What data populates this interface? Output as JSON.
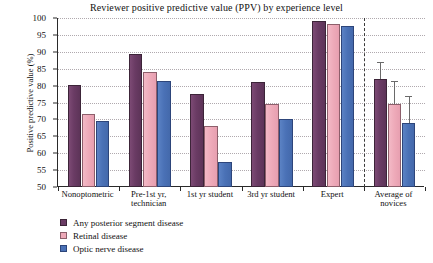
{
  "chart_data": {
    "type": "bar",
    "title": "Reviewer positive predictive value (PPV) by experience level",
    "xlabel": "",
    "ylabel": "Positive predictive value (%)",
    "ylim": [
      50,
      100
    ],
    "ytick_step": 5,
    "yticks": [
      50,
      55,
      60,
      65,
      70,
      75,
      80,
      85,
      90,
      95,
      100
    ],
    "grid": true,
    "legend_position": "bottom-left",
    "categories": [
      "Nonoptometric",
      "Pre-1st yr,\ntechnician",
      "1st yr student",
      "3rd yr student",
      "Expert",
      "Average of\nnovices"
    ],
    "category_lines": [
      [
        "Nonoptometric"
      ],
      [
        "Pre-1st yr,",
        "technician"
      ],
      [
        "1st yr student"
      ],
      [
        "3rd yr student"
      ],
      [
        "Expert"
      ],
      [
        "Average of",
        "novices"
      ]
    ],
    "series": [
      {
        "name": "Any posterior segment disease",
        "color": "#6a3b64",
        "values": [
          80.3,
          89.5,
          77.5,
          81.0,
          99.0,
          82.0
        ],
        "errors": [
          null,
          null,
          null,
          null,
          null,
          5.0
        ]
      },
      {
        "name": "Retinal disease",
        "color": "#eeaab9",
        "values": [
          71.5,
          84.0,
          68.0,
          74.5,
          98.3,
          74.5
        ],
        "errors": [
          null,
          null,
          null,
          null,
          null,
          7.0
        ]
      },
      {
        "name": "Optic nerve disease",
        "color": "#4a71b6",
        "values": [
          69.5,
          81.5,
          57.5,
          70.0,
          97.5,
          69.0
        ],
        "errors": [
          null,
          null,
          null,
          null,
          null,
          8.0
        ]
      }
    ],
    "annotations": [
      {
        "type": "vertical-dashed-separator",
        "after_category_index": 4,
        "description": "Dashed line separating individual groups from the pooled novice average"
      }
    ]
  }
}
